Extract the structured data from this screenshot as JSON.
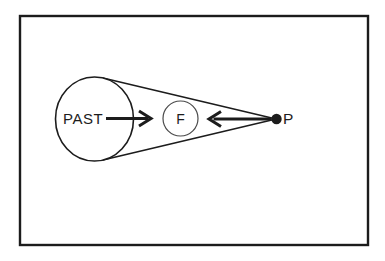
{
  "figure": {
    "labels": {
      "past": "PAST",
      "f": "F",
      "p": "P"
    },
    "colors": {
      "background": "#ffffff",
      "ink": "#1c1c1c",
      "small_circle_stroke": "#4a4a4a"
    }
  }
}
